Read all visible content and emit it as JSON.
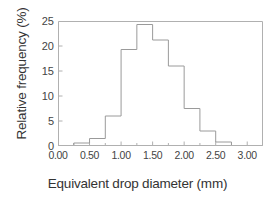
{
  "chart_data": {
    "type": "bar",
    "title": "",
    "subtitle": "",
    "xlabel": "Equivalent drop diameter (mm)",
    "ylabel": "Relative frequency (%)",
    "xlim": [
      0.0,
      3.25
    ],
    "ylim": [
      0,
      25
    ],
    "grid": false,
    "legend": null,
    "bin_width": 0.25,
    "bin_edges": [
      0.0,
      0.25,
      0.5,
      0.75,
      1.0,
      1.25,
      1.5,
      1.75,
      2.0,
      2.25,
      2.5,
      2.75,
      3.0,
      3.25
    ],
    "categories": [
      "0.00-0.25",
      "0.25-0.50",
      "0.50-0.75",
      "0.75-1.00",
      "1.00-1.25",
      "1.25-1.50",
      "1.50-1.75",
      "1.75-2.00",
      "2.00-2.25",
      "2.25-2.50",
      "2.50-2.75",
      "2.75-3.00",
      "3.00-3.25"
    ],
    "values": [
      0.0,
      0.6,
      1.5,
      6.0,
      19.3,
      24.3,
      21.2,
      16.0,
      7.5,
      3.0,
      0.8,
      0.0,
      0.0
    ],
    "xticks": [
      0.0,
      0.5,
      1.0,
      1.5,
      2.0,
      2.5,
      3.0
    ],
    "xtick_labels": [
      "0.00",
      "0.50",
      "1.00",
      "1.50",
      "2.00",
      "2.50",
      "3.00"
    ],
    "yticks": [
      0,
      5,
      10,
      15,
      20,
      25
    ],
    "ytick_labels": [
      "0",
      "5",
      "10",
      "15",
      "20",
      "25"
    ],
    "line_color": "#9a9a9a",
    "frame_color": "#b0b0b0",
    "background": "#ffffff",
    "annotations": []
  }
}
